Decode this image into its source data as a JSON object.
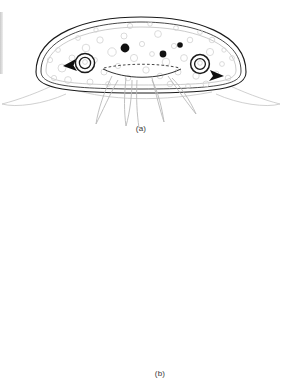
{
  "figure": {
    "background_color": "#ffffff",
    "ink_color": "#1a1a1a",
    "faint_ink_color": "#c0c0c0",
    "top_text_fragment": "",
    "panels": [
      {
        "id": "a",
        "caption": "(a)",
        "description": "lateral view of bell-shaped transparent organism with internal vesicles, three dark spots, paired ring organs with black arrowheads, and splayed tentacles",
        "features": {
          "dark_spots": 3,
          "ring_organs": 2,
          "arrowheads": 2,
          "tentacles": 6,
          "vesicle_count": 46
        }
      },
      {
        "id": "b",
        "caption": "(b)",
        "description": "whole-body view of granulated ovoid mass composed of densely packed cells with five jointed spiny appendages radiating below",
        "features": {
          "legs": 5,
          "cell_count": 300
        }
      }
    ]
  }
}
